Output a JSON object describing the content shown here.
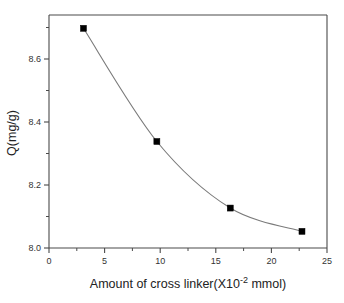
{
  "chart_data": {
    "type": "line",
    "title": "",
    "xlabel": "Amount of cross linker(X10⁻² mmol)",
    "xlabel_main": "Amount of cross linker(X10",
    "xlabel_sup": "-2",
    "xlabel_tail": " mmol)",
    "ylabel": "Q(mg/g)",
    "x": [
      3.1,
      9.7,
      16.3,
      22.75
    ],
    "values": [
      8.66,
      8.32,
      8.12,
      8.05
    ],
    "series": [
      {
        "name": "Q vs cross linker",
        "x": [
          3.1,
          9.7,
          16.3,
          22.75
        ],
        "values": [
          8.66,
          8.32,
          8.12,
          8.05
        ]
      }
    ],
    "xlim": [
      0,
      25
    ],
    "ylim": [
      8.0,
      8.7
    ],
    "xticks": [
      0,
      5,
      10,
      15,
      20,
      25
    ],
    "xticklabels": [
      "0",
      "5",
      "10",
      "15",
      "20",
      "25"
    ],
    "xminorticks": [
      2.5,
      7.5,
      12.5,
      17.5,
      22.5
    ],
    "yticks": [
      8.0,
      8.2,
      8.4,
      8.6
    ],
    "yticklabels": [
      "8.0",
      "8.2",
      "8.4",
      "8.6"
    ],
    "yminorticks": [
      8.1,
      8.3,
      8.5,
      8.7
    ],
    "grid": false,
    "legend": false,
    "marker": "filled-square",
    "marker_color": "#000000",
    "line_color": "#7a7a7a",
    "background": "#ffffff",
    "frame_color": "#4a4a4a"
  },
  "axes": {
    "x_tick_0": "0",
    "x_tick_1": "5",
    "x_tick_2": "10",
    "x_tick_3": "15",
    "x_tick_4": "20",
    "x_tick_5": "25",
    "y_tick_0": "8.0",
    "y_tick_1": "8.2",
    "y_tick_2": "8.4",
    "y_tick_3": "8.6"
  }
}
